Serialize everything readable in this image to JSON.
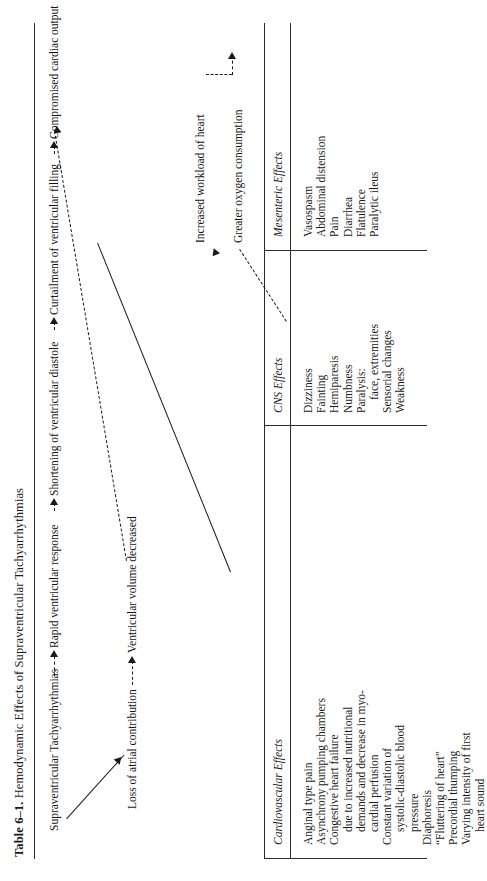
{
  "title": {
    "number": "Table 6–1.",
    "text": "Hemodynamic Effects of Supraventricular Tachyarrhythmias"
  },
  "diagram": {
    "nodes": {
      "root": "Supraventricular Tachyarrhythmias",
      "rapid_response": "Rapid ventricular response",
      "shortening": "Shortening of ventricular diastole",
      "curtailment": "Curtailment of ventricular filling",
      "compromised": "Compromised cardiac output",
      "workload": "Increased workload of heart",
      "oxygen": "Greater oxygen consumption",
      "atrial_loss": "Loss of atrial contribution",
      "volume_decreased": "Ventricular volume decreased"
    }
  },
  "columns": [
    {
      "header": "Cardiovascular Effects",
      "items": [
        {
          "text": "Anginal type pain",
          "indent": false
        },
        {
          "text": "Asynchrony pumping chambers",
          "indent": false
        },
        {
          "text": "Congestive heart failure",
          "indent": false
        },
        {
          "text": "due to increased nutritional",
          "indent": true
        },
        {
          "text": "demands and decrease in myo-",
          "indent": true
        },
        {
          "text": "cardial perfusion",
          "indent": true
        },
        {
          "text": "Constant variation of",
          "indent": false
        },
        {
          "text": "systolic-diastolic blood",
          "indent": true
        },
        {
          "text": "pressure",
          "indent": true
        },
        {
          "text": "Diaphoresis",
          "indent": false
        },
        {
          "text": "“Fluttering of heart”",
          "indent": false
        },
        {
          "text": "Precordial thumping",
          "indent": false
        },
        {
          "text": "Varying intensity of first",
          "indent": false
        },
        {
          "text": "heart sound",
          "indent": true
        }
      ]
    },
    {
      "header": "CNS Effects",
      "items": [
        {
          "text": "Dizziness",
          "indent": false
        },
        {
          "text": "Fainting",
          "indent": false
        },
        {
          "text": "Hemiparesis",
          "indent": false
        },
        {
          "text": "Numbness",
          "indent": false
        },
        {
          "text": "Paralysis:",
          "indent": false
        },
        {
          "text": "face, extremities",
          "indent": true
        },
        {
          "text": "Sensorial changes",
          "indent": false
        },
        {
          "text": "Weakness",
          "indent": false
        }
      ]
    },
    {
      "header": "Mesenteric Effects",
      "items": [
        {
          "text": "Vasospasm",
          "indent": false
        },
        {
          "text": "Abdominal distension",
          "indent": false
        },
        {
          "text": "Pain",
          "indent": false
        },
        {
          "text": "Diarrhea",
          "indent": false
        },
        {
          "text": "Flatulence",
          "indent": false
        },
        {
          "text": "Paralytic ileus",
          "indent": false
        }
      ]
    }
  ]
}
